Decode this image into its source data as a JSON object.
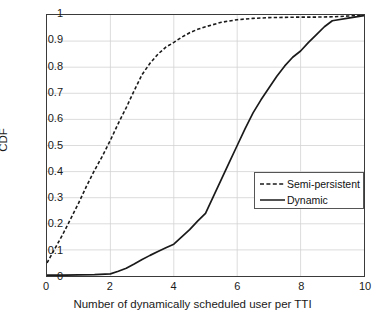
{
  "chart_data": {
    "type": "line",
    "title": "",
    "xlabel": "Number of dynamically scheduled user per TTI",
    "ylabel": "CDF",
    "xlim": [
      0,
      10
    ],
    "ylim": [
      0,
      1
    ],
    "xticks": [
      "0",
      "2",
      "4",
      "6",
      "8",
      "10"
    ],
    "xtick_values": [
      0,
      2,
      4,
      6,
      8,
      10
    ],
    "yticks": [
      "0",
      "0.1",
      "0.2",
      "0.3",
      "0.4",
      "0.5",
      "0.6",
      "0.7",
      "0.8",
      "0.9",
      "1"
    ],
    "ytick_values": [
      0,
      0.1,
      0.2,
      0.3,
      0.4,
      0.5,
      0.6,
      0.7,
      0.8,
      0.9,
      1
    ],
    "grid": true,
    "legend_position": "center-right",
    "series": [
      {
        "name": "Semi-persistent",
        "style": "dashed",
        "color": "#1a1a1a",
        "x": [
          0,
          0.25,
          0.5,
          0.75,
          1.0,
          1.25,
          1.5,
          1.75,
          2.0,
          2.25,
          2.5,
          2.75,
          3.0,
          3.25,
          3.5,
          3.75,
          4.0,
          4.25,
          4.5,
          4.75,
          5.0,
          5.5,
          6.0,
          6.5,
          7.0,
          7.5,
          8.0,
          8.5,
          9.0,
          9.5,
          10.0
        ],
        "y": [
          0.05,
          0.105,
          0.16,
          0.22,
          0.28,
          0.345,
          0.405,
          0.46,
          0.52,
          0.585,
          0.645,
          0.71,
          0.772,
          0.815,
          0.85,
          0.877,
          0.895,
          0.915,
          0.932,
          0.945,
          0.955,
          0.972,
          0.982,
          0.987,
          0.99,
          0.991,
          0.992,
          0.992,
          0.993,
          0.996,
          1.0
        ]
      },
      {
        "name": "Dynamic",
        "style": "solid",
        "color": "#1a1a1a",
        "x": [
          0,
          0.5,
          1.0,
          1.5,
          2.0,
          2.25,
          2.5,
          2.75,
          3.0,
          3.25,
          3.5,
          3.75,
          4.0,
          4.25,
          4.5,
          4.75,
          5.0,
          5.25,
          5.5,
          5.75,
          6.0,
          6.25,
          6.5,
          6.75,
          7.0,
          7.25,
          7.5,
          7.75,
          8.0,
          8.25,
          8.5,
          8.75,
          9.0,
          9.5,
          10.0
        ],
        "y": [
          0.003,
          0.003,
          0.004,
          0.005,
          0.008,
          0.018,
          0.03,
          0.046,
          0.063,
          0.079,
          0.094,
          0.108,
          0.122,
          0.15,
          0.178,
          0.21,
          0.24,
          0.305,
          0.37,
          0.435,
          0.5,
          0.565,
          0.625,
          0.675,
          0.72,
          0.765,
          0.805,
          0.838,
          0.862,
          0.895,
          0.925,
          0.955,
          0.978,
          0.988,
          0.998
        ]
      }
    ]
  },
  "legend": {
    "items": [
      {
        "label": "Semi-persistent",
        "style": "dashed"
      },
      {
        "label": "Dynamic",
        "style": "solid"
      }
    ]
  }
}
